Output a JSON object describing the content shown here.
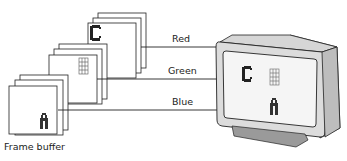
{
  "diagram": {
    "caption": "Frame buffer",
    "channels": [
      {
        "label": "Red",
        "letter": "C"
      },
      {
        "label": "Green",
        "letter": "B"
      },
      {
        "label": "Blue",
        "letter": "A"
      }
    ],
    "monitor": {
      "screen_letters": [
        "C",
        "B",
        "A"
      ]
    },
    "colors": {
      "line": "#222222",
      "frame_fill": "#ffffff",
      "monitor_body": "#d4d4d4",
      "monitor_side": "#a8a8a8",
      "screen": "#f4f4f4"
    }
  }
}
